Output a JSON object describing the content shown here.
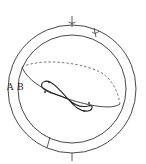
{
  "diagram": {
    "type": "celestial-sphere-analemma",
    "labels": {
      "a": "A",
      "b": "B"
    },
    "colors": {
      "line": "#333333",
      "background": "#ffffff"
    },
    "elements": [
      "outer-ring",
      "inner-circle",
      "ecliptic-great-circle",
      "figure-eight-analemma",
      "top-marker",
      "inner-marker",
      "bottom-tick"
    ]
  }
}
